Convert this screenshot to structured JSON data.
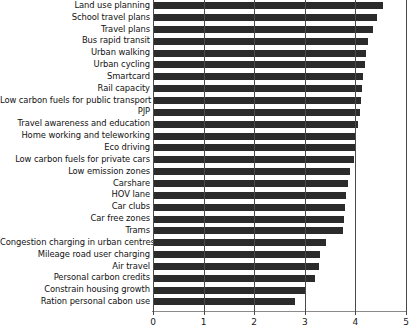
{
  "chart_data": {
    "type": "bar",
    "orientation": "horizontal",
    "title": "",
    "xlabel": "",
    "ylabel": "",
    "xlim": [
      0,
      5
    ],
    "xticks": [
      0,
      1,
      2,
      3,
      4,
      5
    ],
    "xtick_labels": [
      "0",
      "1",
      "2",
      "3",
      "4",
      "5"
    ],
    "grid": true,
    "grid_axis": "x",
    "legend": false,
    "bar_color": "#2b2b2b",
    "categories": [
      "Land use planning",
      "School travel plans",
      "Travel plans",
      "Bus rapid transit",
      "Urban walking",
      "Urban cycling",
      "Smartcard",
      "Rail capacity",
      "Low carbon fuels for public transport",
      "PJP",
      "Travel awareness and education",
      "Home working and teleworking",
      "Eco driving",
      "Low carbon fuels for private cars",
      "Low emission zones",
      "Carshare",
      "HOV lane",
      "Car clubs",
      "Car free zones",
      "Trams",
      "Congestion charging in urban centres",
      "Mileage road user charging",
      "Air travel",
      "Personal carbon credits",
      "Constrain housing growth",
      "Ration personal cabon use"
    ],
    "values": [
      4.55,
      4.43,
      4.35,
      4.25,
      4.2,
      4.18,
      4.15,
      4.13,
      4.12,
      4.1,
      4.05,
      4.02,
      4.0,
      3.98,
      3.9,
      3.85,
      3.82,
      3.8,
      3.78,
      3.75,
      3.42,
      3.3,
      3.28,
      3.2,
      3.0,
      2.81
    ]
  }
}
